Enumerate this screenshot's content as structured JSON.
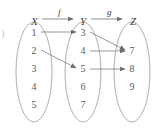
{
  "figure": {
    "corner_mark": ")",
    "sets": [
      {
        "name": "X",
        "label_x": 31,
        "label_y": 16,
        "ellipse_cx": 34,
        "ellipse_cy": 72,
        "ellipse_rx": 18,
        "ellipse_ry": 50,
        "elements": [
          {
            "value": "1",
            "x": 34,
            "y": 33
          },
          {
            "value": "2",
            "x": 34,
            "y": 51
          },
          {
            "value": "3",
            "x": 34,
            "y": 69
          },
          {
            "value": "4",
            "x": 34,
            "y": 87
          },
          {
            "value": "5",
            "x": 34,
            "y": 105
          }
        ]
      },
      {
        "name": "Y",
        "label_x": 80,
        "label_y": 16,
        "ellipse_cx": 83,
        "ellipse_cy": 72,
        "ellipse_rx": 18,
        "ellipse_ry": 50,
        "elements": [
          {
            "value": "3",
            "x": 83,
            "y": 33
          },
          {
            "value": "4",
            "x": 83,
            "y": 51
          },
          {
            "value": "5",
            "x": 83,
            "y": 69
          },
          {
            "value": "6",
            "x": 83,
            "y": 87
          },
          {
            "value": "7",
            "x": 83,
            "y": 105
          }
        ]
      },
      {
        "name": "Z",
        "label_x": 130,
        "label_y": 16,
        "ellipse_cx": 132,
        "ellipse_cy": 72,
        "ellipse_rx": 18,
        "ellipse_ry": 50,
        "elements": [
          {
            "value": "7",
            "x": 132,
            "y": 51
          },
          {
            "value": "8",
            "x": 132,
            "y": 69
          },
          {
            "value": "9",
            "x": 132,
            "y": 87
          }
        ]
      }
    ],
    "maps": [
      {
        "name": "f",
        "label_x": 58,
        "label_y": 8,
        "from": "X",
        "to": "Y",
        "arrow_x1": 42,
        "arrow_y1": 19,
        "arrow_x2": 73,
        "arrow_y2": 19
      },
      {
        "name": "g",
        "label_x": 107,
        "label_y": 8,
        "from": "Y",
        "to": "Z",
        "arrow_x1": 91,
        "arrow_y1": 19,
        "arrow_x2": 122,
        "arrow_y2": 19
      }
    ],
    "mappings": [
      {
        "map": "f",
        "from": "1",
        "to": "3",
        "x1": 41,
        "y1": 32,
        "x2": 76,
        "y2": 32
      },
      {
        "map": "f",
        "from": "2",
        "to": "5",
        "x1": 41,
        "y1": 50,
        "x2": 76,
        "y2": 68
      },
      {
        "map": "g",
        "from": "3",
        "to": "7",
        "x1": 90,
        "y1": 32,
        "x2": 125,
        "y2": 50
      },
      {
        "map": "g",
        "from": "4",
        "to": "7",
        "x1": 90,
        "y1": 51,
        "x2": 125,
        "y2": 51
      },
      {
        "map": "g",
        "from": "5",
        "to": "8",
        "x1": 90,
        "y1": 69,
        "x2": 125,
        "y2": 69
      }
    ],
    "colors": {
      "ellipse_stroke": "#9a9a9a",
      "arrow_stroke": "#6e6e6e",
      "text": "#5a5a5a",
      "background": "#ffffff"
    }
  }
}
